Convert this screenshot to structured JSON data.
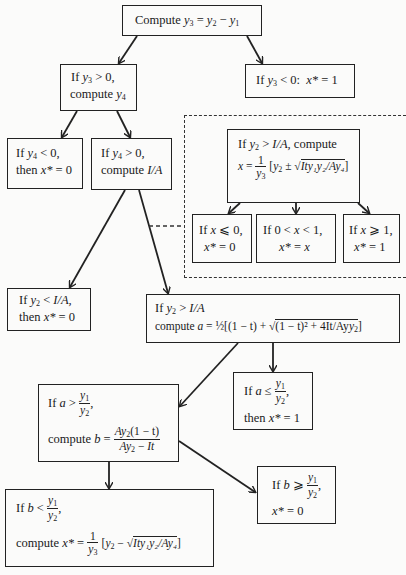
{
  "diagram": {
    "type": "decision-flowchart",
    "nodes": {
      "root": {
        "text": "Compute y3 = y2 − y1",
        "label_prefix": "Compute"
      },
      "y3_pos": {
        "line1": "If y3 > 0,",
        "line2": "compute y4"
      },
      "y3_neg": {
        "text": "If y3 < 0:  x* = 1"
      },
      "y4_neg": {
        "line1": "If y4 < 0,",
        "line2": "then x* = 0"
      },
      "y4_pos": {
        "line1": "If y4 > 0,",
        "line2": "compute I/A"
      },
      "alt_compute_x": {
        "line1": "If y2 > I/A, compute",
        "line2": "x = (1/y3)[y2 ± √(Ity1y2/Ay4)]"
      },
      "x_le_0": {
        "line1": "If x ≤ 0,",
        "line2": "x* = 0"
      },
      "x_between": {
        "line1": "If 0 < x < 1,",
        "line2": "x* = x"
      },
      "x_ge_1": {
        "line1": "If x ≥ 1,",
        "line2": "x* = 1"
      },
      "y2_lt_IA": {
        "line1": "If y2 < I/A,",
        "line2": "then x* = 0"
      },
      "y2_gt_IA": {
        "line1": "If y2 > I/A",
        "line2": "compute a = ½[(1 − t) + √((1 − t)² + 4It/Ay2)]"
      },
      "a_le": {
        "line1": "If a ≤ y1/y2,",
        "line2": "then x* = 1"
      },
      "a_gt": {
        "line1": "If a > y1/y2,",
        "line2": "compute b = Ay2(1 − t) / (Ay2 − It)"
      },
      "b_ge": {
        "line1": "If b ≥ y1/y2,",
        "line2": "x* = 0"
      },
      "b_lt": {
        "line1": "If b < y1/y2,",
        "line2": "compute x* = (1/y3)[y2 − √(Ity1y2/Ay4)]"
      }
    },
    "edges": [
      [
        "root",
        "y3_pos"
      ],
      [
        "root",
        "y3_neg"
      ],
      [
        "y3_pos",
        "y4_neg"
      ],
      [
        "y3_pos",
        "y4_pos"
      ],
      [
        "y4_pos",
        "y2_lt_IA"
      ],
      [
        "y4_pos",
        "y2_gt_IA"
      ],
      [
        "alt_compute_x",
        "x_le_0"
      ],
      [
        "alt_compute_x",
        "x_between"
      ],
      [
        "alt_compute_x",
        "x_ge_1"
      ],
      [
        "y2_gt_IA",
        "a_gt"
      ],
      [
        "y2_gt_IA",
        "a_le"
      ],
      [
        "a_gt",
        "b_lt"
      ],
      [
        "a_gt",
        "b_ge"
      ]
    ],
    "dashed_link": [
      "y4_pos",
      "alternative_region"
    ],
    "text": {
      "compute": "Compute",
      "if": "If",
      "then": "then",
      "compute_lc": "compute",
      "comma": ",",
      "eq": "=",
      "minus": "−",
      "plus": "+",
      "pm": "±",
      "gt": ">",
      "lt": "<",
      "le": "≤",
      "ge": "≥",
      "leq_slant": "⩽",
      "geq_slant": "⩾",
      "colon": ":",
      "zero": "0",
      "one": "1",
      "half": "½",
      "y": "y",
      "x": "x",
      "xstar": "x*",
      "a": "a",
      "b": "b",
      "IA": "I/A",
      "IA_comma": "I/A,",
      "one_minus_t": "(1 − t)",
      "one_minus_t_sq": "(1 − t)²",
      "four_It_Ay": "+ 4It/Ay",
      "Ity1y2_Ay4": "Ity₁y₂/Ay₄",
      "Ay": "Ay",
      "It": "It",
      "sub1": "1",
      "sub2": "2",
      "sub3": "3",
      "sub4": "4"
    }
  }
}
